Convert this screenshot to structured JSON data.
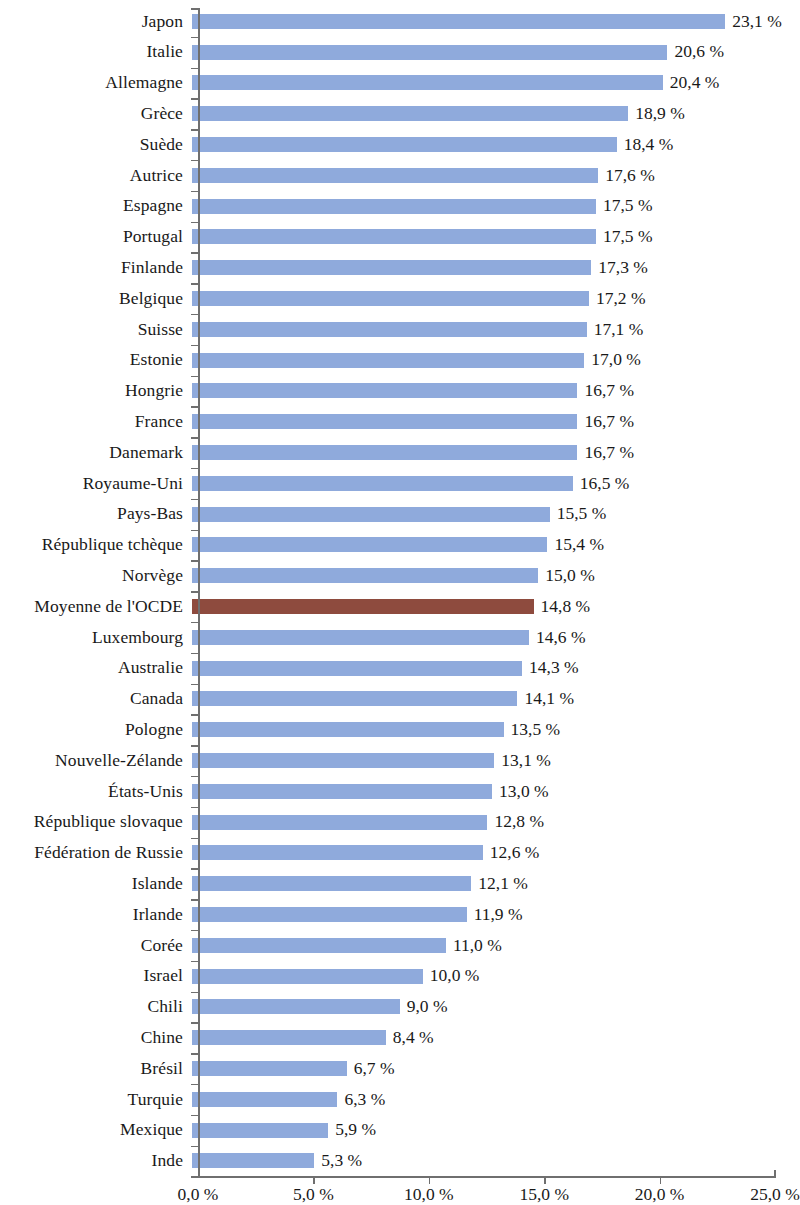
{
  "chart_data": {
    "type": "bar",
    "orientation": "horizontal",
    "title": "",
    "subtitle": "",
    "xlabel": "",
    "ylabel": "",
    "xlim": [
      0,
      25
    ],
    "xtick_values": [
      0,
      5,
      10,
      15,
      20,
      25
    ],
    "xtick_labels": [
      "0,0 %",
      "5,0 %",
      "10,0 %",
      "15,0 %",
      "20,0 %",
      "25,0 %"
    ],
    "grid": false,
    "legend": "none",
    "value_label_suffix": " %",
    "decimal_separator": ",",
    "bar_color": "#8faadc",
    "highlight_color": "#8e4b3e",
    "highlight_category": "Moyenne de l'OCDE",
    "axis_color": "#6f6f6f",
    "categories": [
      "Japon",
      "Italie",
      "Allemagne",
      "Grèce",
      "Suède",
      "Autrice",
      "Espagne",
      "Portugal",
      "Finlande",
      "Belgique",
      "Suisse",
      "Estonie",
      "Hongrie",
      "France",
      "Danemark",
      "Royaume-Uni",
      "Pays-Bas",
      "République tchèque",
      "Norvège",
      "Moyenne de l'OCDE",
      "Luxembourg",
      "Australie",
      "Canada",
      "Pologne",
      "Nouvelle-Zélande",
      "États-Unis",
      "République slovaque",
      "Fédération de Russie",
      "Islande",
      "Irlande",
      "Corée",
      "Israel",
      "Chili",
      "Chine",
      "Brésil",
      "Turquie",
      "Mexique",
      "Inde"
    ],
    "values": [
      23.1,
      20.6,
      20.4,
      18.9,
      18.4,
      17.6,
      17.5,
      17.5,
      17.3,
      17.2,
      17.1,
      17.0,
      16.7,
      16.7,
      16.7,
      16.5,
      15.5,
      15.4,
      15.0,
      14.8,
      14.6,
      14.3,
      14.1,
      13.5,
      13.1,
      13.0,
      12.8,
      12.6,
      12.1,
      11.9,
      11.0,
      10.0,
      9.0,
      8.4,
      6.7,
      6.3,
      5.9,
      5.3
    ],
    "value_labels": [
      "23,1 %",
      "20,6 %",
      "20,4 %",
      "18,9 %",
      "18,4 %",
      "17,6 %",
      "17,5 %",
      "17,5 %",
      "17,3 %",
      "17,2 %",
      "17,1 %",
      "17,0 %",
      "16,7 %",
      "16,7 %",
      "16,7 %",
      "16,5 %",
      "15,5 %",
      "15,4 %",
      "15,0 %",
      "14,8 %",
      "14,6 %",
      "14,3 %",
      "14,1 %",
      "13,5 %",
      "13,1 %",
      "13,0 %",
      "12,8 %",
      "12,6 %",
      "12,1 %",
      "11,9 %",
      "11,0 %",
      "10,0 %",
      "9,0 %",
      "8,4 %",
      "6,7 %",
      "6,3 %",
      "5,9 %",
      "5,3 %"
    ]
  }
}
